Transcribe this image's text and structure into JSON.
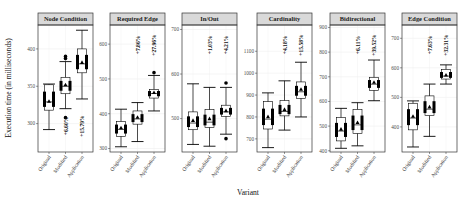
{
  "chart_data": {
    "type": "box",
    "xlabel": "Variant",
    "ylabel": "Execution time (in milliseconds)",
    "categories": [
      "Original",
      "Modified",
      "Application"
    ],
    "facets": [
      {
        "title": "Node Condition",
        "ylim": [
          262,
          432
        ],
        "yticks": [
          300,
          350,
          400
        ],
        "boxes": [
          {
            "variant": "Original",
            "whisker_low": 292,
            "q1": 318,
            "median": 329,
            "q3": 352,
            "whisker_high": 353,
            "mean": 330,
            "outliers": []
          },
          {
            "variant": "Modified",
            "whisker_low": 320,
            "q1": 340,
            "median": 350,
            "q3": 362,
            "whisker_high": 383,
            "mean": 352,
            "outliers": [
              308,
              387,
              390
            ]
          },
          {
            "variant": "Application",
            "whisker_low": 333,
            "q1": 368,
            "median": 380,
            "q3": 400,
            "whisker_high": 425,
            "mean": 382,
            "outliers": []
          }
        ],
        "annotations": [
          {
            "variant": "Modified",
            "text": "+6.60%"
          },
          {
            "variant": "Application",
            "text": "+15.79%"
          }
        ],
        "annotation_position": "below"
      },
      {
        "title": "Required Edge",
        "ylim": [
          290,
          655
        ],
        "yticks": [
          300,
          400,
          500,
          600
        ],
        "boxes": [
          {
            "variant": "Original",
            "whisker_low": 305,
            "q1": 335,
            "median": 355,
            "q3": 378,
            "whisker_high": 413,
            "mean": 360,
            "outliers": []
          },
          {
            "variant": "Modified",
            "whisker_low": 320,
            "q1": 370,
            "median": 385,
            "q3": 408,
            "whisker_high": 432,
            "mean": 390,
            "outliers": []
          },
          {
            "variant": "Application",
            "whisker_low": 408,
            "q1": 445,
            "median": 458,
            "q3": 470,
            "whisker_high": 510,
            "mean": 461,
            "outliers": [
              518
            ]
          }
        ],
        "annotations": [
          {
            "variant": "Modified",
            "text": "+7.86%"
          },
          {
            "variant": "Application",
            "text": "+27.96%"
          }
        ],
        "annotation_position": "above"
      },
      {
        "title": "In/Out",
        "ylim": [
          425,
          710
        ],
        "yticks": [
          500,
          600,
          700
        ],
        "boxes": [
          {
            "variant": "Original",
            "whisker_low": 442,
            "q1": 475,
            "median": 490,
            "q3": 515,
            "whisker_high": 578,
            "mean": 496,
            "outliers": []
          },
          {
            "variant": "Modified",
            "whisker_low": 438,
            "q1": 480,
            "median": 492,
            "q3": 520,
            "whisker_high": 570,
            "mean": 500,
            "outliers": []
          },
          {
            "variant": "Application",
            "whisker_low": 465,
            "q1": 505,
            "median": 515,
            "q3": 530,
            "whisker_high": 570,
            "mean": 518,
            "outliers": [
              455,
              580
            ]
          }
        ],
        "annotations": [
          {
            "variant": "Modified",
            "text": "+1.03%"
          },
          {
            "variant": "Application",
            "text": "+4.21%"
          }
        ],
        "annotation_position": "above"
      },
      {
        "title": "Cardinality",
        "ylim": [
          640,
          1220
        ],
        "yticks": [
          700,
          800,
          900,
          1000,
          1100
        ],
        "boxes": [
          {
            "variant": "Original",
            "whisker_low": 660,
            "q1": 745,
            "median": 790,
            "q3": 870,
            "whisker_high": 910,
            "mean": 802,
            "outliers": []
          },
          {
            "variant": "Modified",
            "whisker_low": 740,
            "q1": 805,
            "median": 825,
            "q3": 875,
            "whisker_high": 965,
            "mean": 835,
            "outliers": []
          },
          {
            "variant": "Application",
            "whisker_low": 800,
            "q1": 885,
            "median": 915,
            "q3": 960,
            "whisker_high": 1050,
            "mean": 927,
            "outliers": []
          }
        ],
        "annotations": [
          {
            "variant": "Modified",
            "text": "+4.18%"
          },
          {
            "variant": "Application",
            "text": "+15.58%"
          }
        ],
        "annotation_position": "above"
      },
      {
        "title": "Bidirectional",
        "ylim": [
          395,
          910
        ],
        "yticks": [
          400,
          500,
          600,
          700,
          800,
          900
        ],
        "boxes": [
          {
            "variant": "Original",
            "whisker_low": 410,
            "q1": 440,
            "median": 480,
            "q3": 535,
            "whisker_high": 572,
            "mean": 488,
            "outliers": []
          },
          {
            "variant": "Modified",
            "whisker_low": 420,
            "q1": 470,
            "median": 505,
            "q3": 568,
            "whisker_high": 595,
            "mean": 515,
            "outliers": []
          },
          {
            "variant": "Application",
            "whisker_low": 603,
            "q1": 645,
            "median": 670,
            "q3": 698,
            "whisker_high": 768,
            "mean": 678,
            "outliers": []
          }
        ],
        "annotations": [
          {
            "variant": "Modified",
            "text": "+6.11%"
          },
          {
            "variant": "Application",
            "text": "+39.52%"
          }
        ],
        "annotation_position": "above"
      },
      {
        "title": "Edge Condition",
        "ylim": [
          315,
          745
        ],
        "yticks": [
          400,
          500,
          600,
          700
        ],
        "boxes": [
          {
            "variant": "Original",
            "whisker_low": 332,
            "q1": 390,
            "median": 430,
            "q3": 480,
            "whisker_high": 488,
            "mean": 436,
            "outliers": []
          },
          {
            "variant": "Modified",
            "whisker_low": 368,
            "q1": 438,
            "median": 460,
            "q3": 505,
            "whisker_high": 545,
            "mean": 468,
            "outliers": []
          },
          {
            "variant": "Application",
            "whisker_low": 545,
            "q1": 562,
            "median": 572,
            "q3": 595,
            "whisker_high": 610,
            "mean": 576,
            "outliers": []
          }
        ],
        "annotations": [
          {
            "variant": "Modified",
            "text": "+7.63%"
          },
          {
            "variant": "Application",
            "text": "+32.31%"
          }
        ],
        "annotation_position": "above"
      }
    ]
  }
}
